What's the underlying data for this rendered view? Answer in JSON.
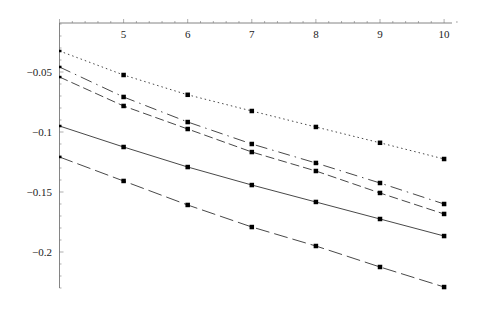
{
  "chart_data": {
    "type": "line",
    "title": "",
    "xlabel": "",
    "ylabel": "",
    "x": [
      4,
      5,
      6,
      7,
      8,
      9,
      10
    ],
    "x_ticks": [
      "5",
      "6",
      "7",
      "8",
      "9",
      "10"
    ],
    "y_ticks": [
      "-0.05",
      "-0.1",
      "-0.15",
      "-0.2"
    ],
    "xlim": [
      4,
      10.2
    ],
    "ylim": [
      -0.24,
      -0.01
    ],
    "grid": false,
    "legend": "none",
    "series": [
      {
        "name": "dotted",
        "style": "dotted",
        "values": [
          -0.0325,
          -0.0525,
          -0.069,
          -0.0825,
          -0.0958,
          -0.109,
          -0.1225
        ]
      },
      {
        "name": "dash-dot",
        "style": "dashdot",
        "values": [
          -0.0458,
          -0.0708,
          -0.0917,
          -0.11,
          -0.1258,
          -0.1425,
          -0.16
        ]
      },
      {
        "name": "medium-dash",
        "style": "dashed",
        "values": [
          -0.0542,
          -0.0783,
          -0.0975,
          -0.1167,
          -0.1325,
          -0.1508,
          -0.1683
        ]
      },
      {
        "name": "solid",
        "style": "solid",
        "values": [
          -0.095,
          -0.1125,
          -0.1292,
          -0.1442,
          -0.1583,
          -0.1725,
          -0.1867
        ]
      },
      {
        "name": "long-dash",
        "style": "longdash",
        "values": [
          -0.1208,
          -0.1408,
          -0.1608,
          -0.1792,
          -0.195,
          -0.2125,
          -0.2292
        ]
      }
    ]
  }
}
